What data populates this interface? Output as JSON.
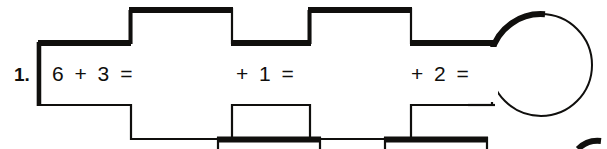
{
  "page": {
    "background_color": "#ffffff",
    "ink_color": "#100f0d",
    "width": 607,
    "height": 149
  },
  "exercise": {
    "number_label": "1.",
    "segments": [
      {
        "id": "segment-1",
        "expression": "6 + 3 ="
      },
      {
        "id": "segment-2",
        "expression": "+ 1 ="
      },
      {
        "id": "segment-3",
        "expression": "+ 2 ="
      }
    ],
    "answer_balloon": {
      "name": "answer-circle",
      "value": ""
    }
  },
  "next_row": {
    "visible_fragment": true,
    "boxes": [
      "",
      ""
    ]
  }
}
